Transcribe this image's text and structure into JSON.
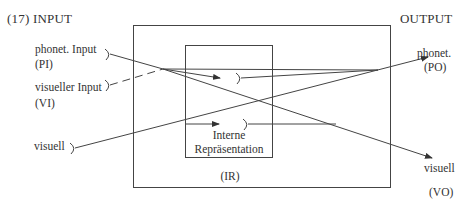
{
  "figure": {
    "number_label": "(17)",
    "left_heading": "INPUT",
    "right_heading": "OUTPUT"
  },
  "inputs": [
    {
      "label": "phonet. Input",
      "abbr": "(PI)"
    },
    {
      "label": "visueller Input",
      "abbr": "(VI)"
    },
    {
      "label": "visuell",
      "abbr": ""
    }
  ],
  "outputs": [
    {
      "label": "phonet.",
      "abbr": "(PO)"
    },
    {
      "label": "visuell",
      "abbr": "(VO)"
    }
  ],
  "inner_box": {
    "line1": "Interne",
    "line2": "Repräsentation"
  },
  "outer_box": {
    "abbr": "(IR)"
  },
  "colors": {
    "ink": "#333333",
    "background": "#ffffff"
  }
}
